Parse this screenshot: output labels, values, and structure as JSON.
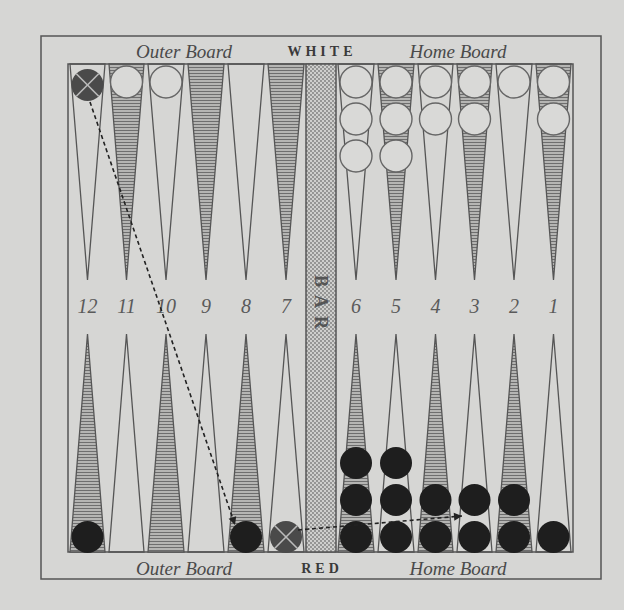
{
  "diagram": {
    "title_top_left": "Outer Board",
    "title_top_center": "WHITE",
    "title_top_right": "Home Board",
    "title_bottom_left": "Outer Board",
    "title_bottom_center": "RED",
    "title_bottom_right": "Home Board",
    "bar_label": "BAR",
    "point_numbers": [
      "12",
      "11",
      "10",
      "9",
      "8",
      "7",
      "6",
      "5",
      "4",
      "3",
      "2",
      "1"
    ]
  },
  "colors": {
    "paper": "#d6d6d4",
    "ink": "#555555",
    "shade": "#8a8a8a",
    "black_checker": "#1e1e1e",
    "white_checker": "#d9d9d7",
    "marked_checker": "#4a4a4a"
  },
  "position": {
    "white_top": [
      {
        "point": 11,
        "count": 1
      },
      {
        "point": 10,
        "count": 1
      },
      {
        "point": 6,
        "count": 3
      },
      {
        "point": 5,
        "count": 3
      },
      {
        "point": 4,
        "count": 2
      },
      {
        "point": 3,
        "count": 2
      },
      {
        "point": 2,
        "count": 1
      },
      {
        "point": 1,
        "count": 2
      }
    ],
    "black_top": [
      {
        "point": 12,
        "count": 1,
        "marked": true
      }
    ],
    "black_bottom": [
      {
        "point": 12,
        "count": 1
      },
      {
        "point": 8,
        "count": 1
      },
      {
        "point": 7,
        "count": 1,
        "marked": true
      },
      {
        "point": 6,
        "count": 3
      },
      {
        "point": 5,
        "count": 3
      },
      {
        "point": 4,
        "count": 2
      },
      {
        "point": 3,
        "count": 2
      },
      {
        "point": 2,
        "count": 2
      },
      {
        "point": 1,
        "count": 1
      }
    ],
    "moves": [
      {
        "from": "top-12",
        "to": "bottom-8"
      },
      {
        "from": "bottom-7",
        "to": "bottom-3"
      }
    ]
  }
}
